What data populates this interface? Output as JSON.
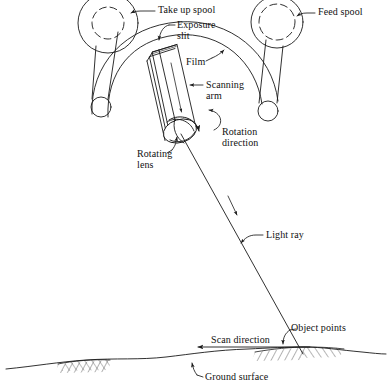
{
  "figure": {
    "kind": "panoramic-scanning-camera-diagram",
    "ink_color": "#1a1a1a",
    "background_color": "#ffffff",
    "width": 388,
    "height": 386
  },
  "labels": {
    "take_up_spool": "Take up spool",
    "feed_spool": "Feed spool",
    "exposure_slit_line1": "Exposure",
    "exposure_slit_line2": "slit",
    "film": "Film",
    "scanning_arm_line1": "Scanning",
    "scanning_arm_line2": "arm",
    "rotation_direction_line1": "Rotation",
    "rotation_direction_line2": "direction",
    "rotating_lens_line1": "Rotating",
    "rotating_lens_line2": "lens",
    "light_ray": "Light ray",
    "object_points": "Object points",
    "scan_direction": "Scan direction",
    "ground_surface": "Ground surface"
  },
  "parts": {
    "take_up_spool": {
      "name": "take-up-spool",
      "cx": 108,
      "cy": 23,
      "r_outer": 30,
      "r_inner": 16
    },
    "feed_spool": {
      "name": "feed-spool",
      "cx": 277,
      "cy": 22,
      "r_outer": 26,
      "r_inner": 18
    },
    "left_roller": {
      "name": "left-roller",
      "cx": 101,
      "cy": 107,
      "r": 10
    },
    "right_roller": {
      "name": "right-roller",
      "cx": 268,
      "cy": 111,
      "r": 10
    },
    "scanning_arm": {
      "name": "scanning-arm-cylinder"
    },
    "rotating_lens": {
      "name": "rotating-lens-ellipse",
      "cx": 180,
      "cy": 131
    },
    "light_ray": {
      "name": "light-ray",
      "from_x": 181,
      "from_y": 134,
      "to_x": 303,
      "to_y": 355
    },
    "ground_surface": {
      "name": "ground-surface-profile"
    },
    "scan_direction_arrow": {
      "name": "scan-direction-arrow",
      "from_x": 310,
      "from_y": 347,
      "to_x": 196,
      "to_y": 347
    }
  }
}
